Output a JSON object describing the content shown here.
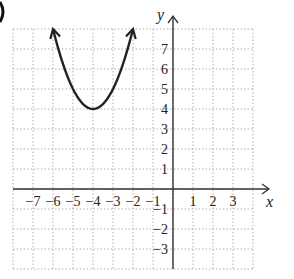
{
  "chart_data": {
    "type": "line",
    "title": "",
    "xlabel": "x",
    "ylabel": "y",
    "xlim": [
      -8,
      4
    ],
    "ylim": [
      -4,
      8
    ],
    "grid": true,
    "grid_style": "dotted",
    "x_ticks": [
      "−7",
      "−6",
      "−5",
      "−4",
      "−3",
      "−2",
      "−1",
      "1",
      "2",
      "3"
    ],
    "x_tick_values": [
      -7,
      -6,
      -5,
      -4,
      -3,
      -2,
      -1,
      1,
      2,
      3
    ],
    "y_ticks": [
      "7",
      "6",
      "5",
      "4",
      "3",
      "2",
      "1",
      "−1",
      "−2",
      "−3"
    ],
    "y_tick_values": [
      7,
      6,
      5,
      4,
      3,
      2,
      1,
      -1,
      -2,
      -3
    ],
    "series": [
      {
        "name": "parabola",
        "equation": "y = (x + 4)^2 + 4",
        "vertex": [
          -4,
          4
        ],
        "x": [
          -6,
          -5.5,
          -5,
          -4.5,
          -4,
          -3.5,
          -3,
          -2.5,
          -2
        ],
        "values": [
          8,
          6.25,
          5,
          4.25,
          4,
          4.25,
          5,
          6.25,
          8
        ],
        "end_arrows": true,
        "color": "#222222"
      }
    ],
    "axis_color": "#333333",
    "grid_color": "#b0b0b0"
  }
}
